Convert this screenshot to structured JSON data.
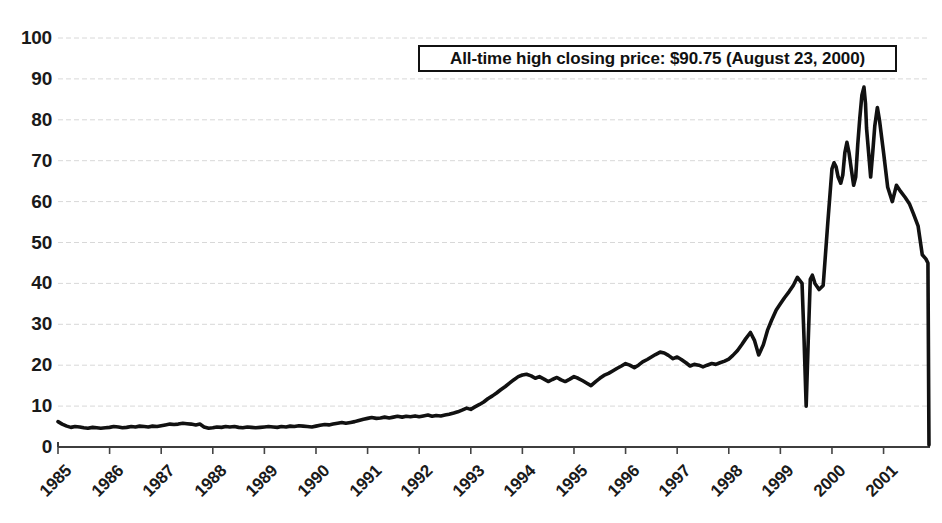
{
  "chart_data": {
    "type": "line",
    "title": "",
    "subtitle": "",
    "xlabel": "",
    "ylabel": "",
    "grid": true,
    "legend": null,
    "legend_position": "none",
    "line_color": "#111111",
    "gridline_color": "#d8d8d8",
    "axis_color": "#444444",
    "xlim": [
      1985,
      2001.9
    ],
    "ylim": [
      0,
      100
    ],
    "ytick_values": [
      0,
      10,
      20,
      30,
      40,
      50,
      60,
      70,
      80,
      90,
      100
    ],
    "ytick_labels": [
      "0",
      "10",
      "20",
      "30",
      "40",
      "50",
      "60",
      "70",
      "80",
      "90",
      "100"
    ],
    "xtick_values": [
      1985,
      1986,
      1987,
      1988,
      1989,
      1990,
      1991,
      1992,
      1993,
      1994,
      1995,
      1996,
      1997,
      1998,
      1999,
      2000,
      2001
    ],
    "xtick_labels": [
      "1985",
      "1986",
      "1987",
      "1988",
      "1989",
      "1990",
      "1991",
      "1992",
      "1993",
      "1994",
      "1995",
      "1996",
      "1997",
      "1998",
      "1999",
      "2000",
      "2001"
    ],
    "annotations": [
      {
        "name": "all-time-high",
        "text": "All-time high closing price: $90.75 (August 23, 2000)",
        "value": 90.75,
        "date": "August 23, 2000",
        "boxed": true
      }
    ],
    "series": [
      {
        "name": "closing price",
        "x": [
          1985.0,
          1985.08,
          1985.17,
          1985.25,
          1985.33,
          1985.42,
          1985.5,
          1985.58,
          1985.67,
          1985.75,
          1985.83,
          1985.92,
          1986.0,
          1986.08,
          1986.17,
          1986.25,
          1986.33,
          1986.42,
          1986.5,
          1986.58,
          1986.67,
          1986.75,
          1986.83,
          1986.92,
          1987.0,
          1987.08,
          1987.17,
          1987.25,
          1987.33,
          1987.42,
          1987.5,
          1987.58,
          1987.67,
          1987.75,
          1987.83,
          1987.92,
          1988.0,
          1988.08,
          1988.17,
          1988.25,
          1988.33,
          1988.42,
          1988.5,
          1988.58,
          1988.67,
          1988.75,
          1988.83,
          1988.92,
          1989.0,
          1989.08,
          1989.17,
          1989.25,
          1989.33,
          1989.42,
          1989.5,
          1989.58,
          1989.67,
          1989.75,
          1989.83,
          1989.92,
          1990.0,
          1990.08,
          1990.17,
          1990.25,
          1990.33,
          1990.42,
          1990.5,
          1990.58,
          1990.67,
          1990.75,
          1990.83,
          1990.92,
          1991.0,
          1991.08,
          1991.17,
          1991.25,
          1991.33,
          1991.42,
          1991.5,
          1991.58,
          1991.67,
          1991.75,
          1991.83,
          1991.92,
          1992.0,
          1992.08,
          1992.17,
          1992.25,
          1992.33,
          1992.42,
          1992.5,
          1992.58,
          1992.67,
          1992.75,
          1992.83,
          1992.92,
          1993.0,
          1993.08,
          1993.17,
          1993.25,
          1993.33,
          1993.42,
          1993.5,
          1993.58,
          1993.67,
          1993.75,
          1993.83,
          1993.92,
          1994.0,
          1994.08,
          1994.17,
          1994.25,
          1994.33,
          1994.42,
          1994.5,
          1994.58,
          1994.67,
          1994.75,
          1994.83,
          1994.92,
          1995.0,
          1995.08,
          1995.17,
          1995.25,
          1995.33,
          1995.42,
          1995.5,
          1995.58,
          1995.67,
          1995.75,
          1995.83,
          1995.92,
          1996.0,
          1996.08,
          1996.17,
          1996.25,
          1996.33,
          1996.42,
          1996.5,
          1996.58,
          1996.67,
          1996.75,
          1996.83,
          1996.92,
          1997.0,
          1997.08,
          1997.17,
          1997.25,
          1997.33,
          1997.42,
          1997.5,
          1997.58,
          1997.67,
          1997.75,
          1997.83,
          1997.92,
          1998.0,
          1998.08,
          1998.17,
          1998.25,
          1998.33,
          1998.42,
          1998.5,
          1998.58,
          1998.67,
          1998.75,
          1998.83,
          1998.92,
          1999.0,
          1999.08,
          1999.17,
          1999.25,
          1999.33,
          1999.42,
          1999.46,
          1999.5,
          1999.54,
          1999.58,
          1999.62,
          1999.67,
          1999.75,
          1999.83,
          1999.92,
          2000.0,
          2000.04,
          2000.08,
          2000.12,
          2000.17,
          2000.21,
          2000.25,
          2000.29,
          2000.33,
          2000.38,
          2000.42,
          2000.46,
          2000.5,
          2000.54,
          2000.58,
          2000.62,
          2000.65,
          2000.67,
          2000.71,
          2000.75,
          2000.79,
          2000.83,
          2000.88,
          2000.92,
          2001.0,
          2001.08,
          2001.17,
          2001.25,
          2001.33,
          2001.42,
          2001.5,
          2001.58,
          2001.67,
          2001.75,
          2001.82,
          2001.86,
          2001.88
        ],
        "values": [
          6.2,
          5.6,
          5.1,
          4.8,
          5.0,
          4.9,
          4.7,
          4.6,
          4.8,
          4.7,
          4.6,
          4.7,
          4.8,
          5.0,
          4.9,
          4.7,
          4.8,
          5.0,
          4.9,
          5.1,
          5.0,
          4.9,
          5.1,
          5.0,
          5.2,
          5.4,
          5.6,
          5.5,
          5.6,
          5.8,
          5.7,
          5.6,
          5.4,
          5.6,
          4.9,
          4.6,
          4.7,
          4.9,
          4.8,
          5.0,
          4.9,
          5.0,
          4.8,
          4.7,
          4.9,
          4.8,
          4.7,
          4.8,
          4.9,
          5.0,
          4.9,
          4.8,
          5.0,
          4.9,
          5.1,
          5.0,
          5.2,
          5.1,
          5.0,
          4.9,
          5.1,
          5.3,
          5.5,
          5.4,
          5.6,
          5.8,
          6.0,
          5.8,
          6.0,
          6.2,
          6.5,
          6.8,
          7.0,
          7.2,
          7.0,
          7.1,
          7.3,
          7.1,
          7.3,
          7.5,
          7.3,
          7.5,
          7.4,
          7.6,
          7.4,
          7.6,
          7.8,
          7.5,
          7.7,
          7.6,
          7.8,
          8.0,
          8.3,
          8.6,
          9.0,
          9.5,
          9.2,
          9.8,
          10.4,
          11.0,
          11.8,
          12.5,
          13.2,
          14.0,
          14.8,
          15.6,
          16.4,
          17.2,
          17.6,
          17.8,
          17.4,
          16.8,
          17.2,
          16.6,
          16.0,
          16.5,
          17.0,
          16.4,
          16.0,
          16.6,
          17.2,
          16.8,
          16.2,
          15.6,
          15.0,
          16.0,
          16.8,
          17.5,
          18.0,
          18.6,
          19.2,
          19.8,
          20.4,
          20.0,
          19.4,
          20.0,
          20.8,
          21.4,
          22.0,
          22.6,
          23.2,
          23.0,
          22.4,
          21.6,
          22.0,
          21.4,
          20.6,
          19.8,
          20.2,
          20.0,
          19.6,
          20.0,
          20.4,
          20.2,
          20.6,
          21.0,
          21.5,
          22.4,
          23.6,
          25.0,
          26.5,
          28.0,
          26.0,
          22.5,
          25.0,
          28.5,
          31.0,
          33.5,
          35.0,
          36.5,
          38.0,
          39.5,
          41.5,
          40.0,
          26.0,
          10.0,
          26.0,
          41.0,
          42.0,
          40.0,
          38.5,
          39.5,
          55.0,
          68.0,
          69.5,
          68.5,
          66.0,
          64.5,
          66.5,
          72.0,
          74.5,
          72.0,
          67.5,
          64.0,
          66.0,
          74.0,
          80.5,
          86.0,
          88.0,
          84.0,
          78.0,
          72.0,
          66.0,
          72.0,
          78.5,
          83.0,
          80.0,
          72.0,
          63.5,
          60.0,
          64.0,
          62.5,
          61.0,
          59.5,
          57.0,
          54.0,
          47.0,
          46.0,
          45.0,
          0.5
        ]
      }
    ]
  }
}
